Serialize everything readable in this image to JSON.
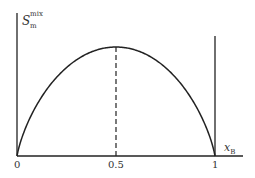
{
  "chart_data": {
    "type": "line",
    "title": "",
    "xlabel": "x_B",
    "ylabel": "S_m^mix",
    "x_ticks": [
      "0",
      "0.5",
      "1"
    ],
    "xlim": [
      0,
      1
    ],
    "grid": false,
    "legend": null,
    "series": [
      {
        "name": "S_m^mix",
        "function": "-x ln x - (1-x) ln(1-x)",
        "x": [
          0,
          0.05,
          0.1,
          0.2,
          0.3,
          0.4,
          0.5,
          0.6,
          0.7,
          0.8,
          0.9,
          0.95,
          1
        ],
        "values": [
          0,
          0.199,
          0.325,
          0.5,
          0.611,
          0.673,
          0.693,
          0.673,
          0.611,
          0.5,
          0.325,
          0.199,
          0
        ]
      }
    ],
    "annotations": [
      {
        "type": "dashed-vertical",
        "x": 0.5,
        "label": "maximum at x_B = 0.5"
      },
      {
        "type": "vertical-line",
        "x": 1
      }
    ]
  },
  "labels": {
    "y_main": "S",
    "y_sup": "mix",
    "y_sub": "m",
    "x_main": "x",
    "x_sub": "B",
    "tick_0": "0",
    "tick_half": "0.5",
    "tick_1": "1"
  }
}
